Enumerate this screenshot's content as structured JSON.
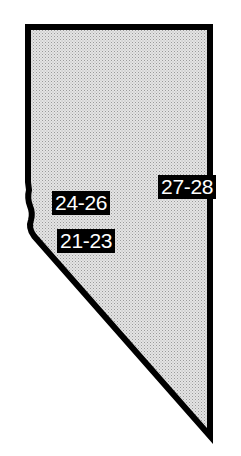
{
  "map": {
    "region": "Nevada",
    "fill_color": "#d9d9d9",
    "stroke_color": "#000000",
    "labels": [
      {
        "id": "24-26",
        "text": "24-26"
      },
      {
        "id": "21-23",
        "text": "21-23"
      },
      {
        "id": "27-28",
        "text": "27-28"
      }
    ]
  }
}
